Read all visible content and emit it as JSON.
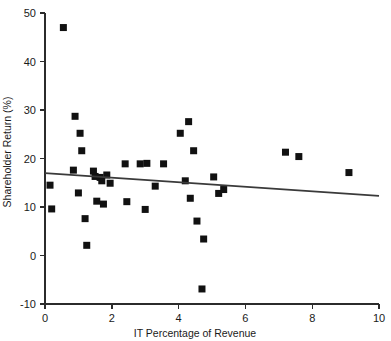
{
  "chart_data": {
    "type": "scatter",
    "title": "",
    "xlabel": "IT Percentage of Revenue",
    "ylabel": "Shareholder Return (%)",
    "xlim": [
      0,
      10
    ],
    "ylim": [
      -10,
      50
    ],
    "xticks": [
      0,
      2,
      4,
      6,
      8,
      10
    ],
    "yticks": [
      -10,
      0,
      10,
      20,
      30,
      40,
      50
    ],
    "xtick_labels": [
      "0",
      "2",
      "4",
      "6",
      "8",
      "10"
    ],
    "ytick_labels": [
      "-10",
      "0",
      "10",
      "20",
      "30",
      "40",
      "50"
    ],
    "grid": false,
    "legend": false,
    "marker": "square",
    "marker_color": "#111111",
    "trendline_color": "#3a3a3a",
    "points": [
      {
        "x": 0.15,
        "y": 14.5
      },
      {
        "x": 0.2,
        "y": 9.6
      },
      {
        "x": 0.55,
        "y": 47.0
      },
      {
        "x": 0.85,
        "y": 17.6
      },
      {
        "x": 0.9,
        "y": 28.7
      },
      {
        "x": 1.0,
        "y": 12.9
      },
      {
        "x": 1.05,
        "y": 25.2
      },
      {
        "x": 1.1,
        "y": 21.6
      },
      {
        "x": 1.2,
        "y": 7.6
      },
      {
        "x": 1.25,
        "y": 2.1
      },
      {
        "x": 1.45,
        "y": 17.4
      },
      {
        "x": 1.5,
        "y": 16.3
      },
      {
        "x": 1.55,
        "y": 11.2
      },
      {
        "x": 1.65,
        "y": 16.1
      },
      {
        "x": 1.7,
        "y": 15.4
      },
      {
        "x": 1.75,
        "y": 10.6
      },
      {
        "x": 1.85,
        "y": 16.6
      },
      {
        "x": 1.95,
        "y": 14.9
      },
      {
        "x": 2.4,
        "y": 18.9
      },
      {
        "x": 2.45,
        "y": 11.1
      },
      {
        "x": 2.85,
        "y": 18.9
      },
      {
        "x": 3.0,
        "y": 9.5
      },
      {
        "x": 3.05,
        "y": 19.0
      },
      {
        "x": 3.3,
        "y": 14.3
      },
      {
        "x": 3.55,
        "y": 18.9
      },
      {
        "x": 4.05,
        "y": 25.2
      },
      {
        "x": 4.2,
        "y": 15.4
      },
      {
        "x": 4.3,
        "y": 27.6
      },
      {
        "x": 4.35,
        "y": 11.8
      },
      {
        "x": 4.45,
        "y": 21.6
      },
      {
        "x": 4.55,
        "y": 7.1
      },
      {
        "x": 4.7,
        "y": -6.9
      },
      {
        "x": 4.75,
        "y": 3.4
      },
      {
        "x": 5.05,
        "y": 16.2
      },
      {
        "x": 5.2,
        "y": 12.8
      },
      {
        "x": 5.35,
        "y": 13.6
      },
      {
        "x": 7.2,
        "y": 21.3
      },
      {
        "x": 7.6,
        "y": 20.4
      },
      {
        "x": 9.1,
        "y": 17.1
      }
    ],
    "trendline": {
      "x": [
        0,
        10
      ],
      "y": [
        17.0,
        12.3
      ]
    }
  }
}
